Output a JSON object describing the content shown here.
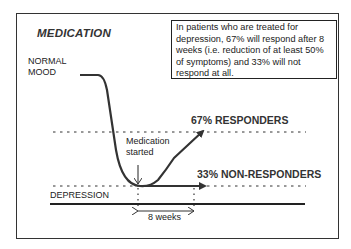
{
  "diagram": {
    "title": "MEDICATION",
    "info_text": "In patients who are treated for depression, 67% will respond after 8 weeks (i.e. reduction of at least 50% of symptoms) and 33% will not respond at all.",
    "labels": {
      "normal_mood_line1": "NORMAL",
      "normal_mood_line2": "MOOD",
      "depression": "DEPRESSION",
      "medication_line1": "Medication",
      "medication_line2": "started",
      "duration": "8 weeks",
      "responders": "67% RESPONDERS",
      "non_responders": "33% NON-RESPONDERS"
    },
    "colors": {
      "line": "#333333",
      "text": "#222222",
      "background": "#ffffff"
    }
  }
}
